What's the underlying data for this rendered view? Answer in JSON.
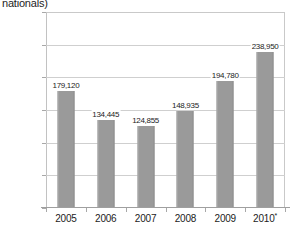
{
  "title_fragment": "nationals)",
  "axis": {
    "y_ticks": [
      "300,000",
      "250,000",
      "200,000",
      "150,000",
      "100,000",
      "50,000",
      "0"
    ]
  },
  "chart_data": {
    "type": "bar",
    "title": "nationals)",
    "subtitle": "",
    "xlabel": "",
    "ylabel": "",
    "categories": [
      "2005",
      "2006",
      "2007",
      "2008",
      "2009",
      "2010*"
    ],
    "values": [
      179120,
      134445,
      124855,
      148935,
      194780,
      238950
    ],
    "value_labels": [
      "179,120",
      "134,445",
      "124,855",
      "148,935",
      "194,780",
      "238,950"
    ],
    "ylim": [
      0,
      300000
    ],
    "ytick_values": [
      300000,
      250000,
      200000,
      150000,
      100000,
      50000,
      0
    ],
    "ytick_labels": [
      "300,000",
      "250,000",
      "200,000",
      "150,000",
      "100,000",
      "50,000",
      "0"
    ],
    "grid": true,
    "grid_axis": "y",
    "legend": false,
    "legend_position": "none",
    "bar_color": "#9a9a9a",
    "gridline_color": "#cfcfcf",
    "annotations": [
      "2010 value marked with an asterisk"
    ]
  }
}
